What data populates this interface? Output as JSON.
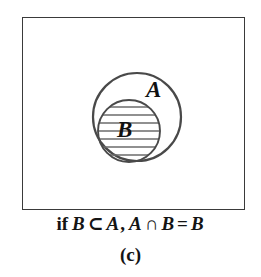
{
  "figure": {
    "subfigure_label": "(c)",
    "caption": {
      "keyword": "if",
      "subset_left": "B",
      "subset_operator": "⊂",
      "subset_right": "A",
      "comma": ",",
      "intersect_left": "A",
      "intersect_operator": "∩",
      "intersect_right": "B",
      "equals": "=",
      "result": "B",
      "full_text": "if B ⊂ A, A ∩ B = B"
    },
    "universe_box": {
      "name": "universal-set-rectangle",
      "x": 22,
      "y": 17,
      "width": 223,
      "height": 193,
      "stroke_color": "#3a3a3a",
      "fill_color": "#ffffff",
      "stroke_width": 1.6
    },
    "sets": [
      {
        "id": "A",
        "label": "A",
        "role": "superset",
        "shape": "circle",
        "cx": 137,
        "cy": 117,
        "r": 44,
        "stroke_color": "#4a4a4a",
        "stroke_width": 2.2,
        "fill": "none",
        "hatched": false,
        "label_x": 155,
        "label_y": 92
      },
      {
        "id": "B",
        "label": "B",
        "role": "subset",
        "shape": "circle",
        "cx": 129,
        "cy": 131,
        "r": 31,
        "stroke_color": "#4a4a4a",
        "stroke_width": 1.9,
        "fill": "none",
        "hatched": true,
        "hatch_orientation": "horizontal",
        "hatch_line_count": 7,
        "hatch_color": "#6b6b6b",
        "hatch_spacing": 8,
        "label_x": 125,
        "label_y": 131
      }
    ],
    "shaded_region": {
      "description": "intersection A ∩ B equals B",
      "set_id": "B"
    }
  }
}
